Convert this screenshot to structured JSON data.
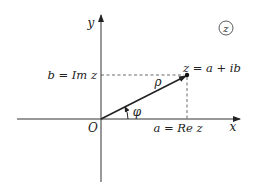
{
  "diagram": {
    "plane_label": "z",
    "axes": {
      "x_label": "x",
      "y_label": "y",
      "origin_label": "O"
    },
    "point": {
      "label": "z = a + ib"
    },
    "projections": {
      "imag_label": "b = Im z",
      "real_label": "a = Re z"
    },
    "vector": {
      "modulus_label": "ρ",
      "angle_label": "φ"
    },
    "colors": {
      "ink": "#222222",
      "background": "#ffffff"
    }
  }
}
